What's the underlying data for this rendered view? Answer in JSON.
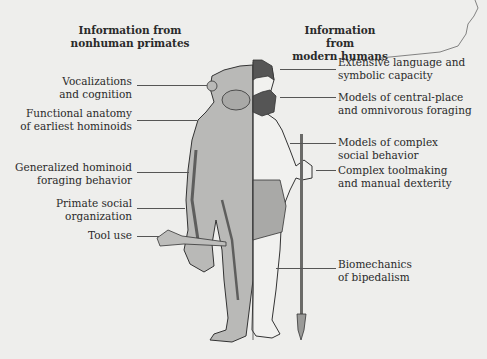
{
  "headers": {
    "left": "Information from nonhuman primates",
    "left_line1": "Information from",
    "left_line2": "nonhuman primates",
    "right_line1": "Information from",
    "right_line2": "modern humans"
  },
  "left_labels": [
    {
      "line1": "Vocalizations",
      "line2": "and cognition"
    },
    {
      "line1": "Functional anatomy",
      "line2": "of earliest hominoids"
    },
    {
      "line1": "Generalized hominoid",
      "line2": "foraging behavior"
    },
    {
      "line1": "Primate social",
      "line2": "organization"
    },
    {
      "line1": "Tool use",
      "line2": ""
    }
  ],
  "right_labels": [
    {
      "line1": "Extensive language and",
      "line2": "symbolic capacity"
    },
    {
      "line1": "Models of central-place",
      "line2": "and omnivorous foraging"
    },
    {
      "line1": "Models of complex",
      "line2": "social behavior"
    },
    {
      "line1": "Complex toolmaking",
      "line2": "and manual dexterity"
    },
    {
      "line1": "Biomechanics",
      "line2": "of bipedalism"
    }
  ],
  "figure": {
    "left_half": "chimpanzee",
    "right_half": "human",
    "colors": {
      "background": "#eeeeec",
      "fur": "#b9b9b7",
      "skin": "#f1f1ef",
      "hair": "#555555",
      "loincloth": "#a9a9a7",
      "outline": "#333333"
    }
  }
}
